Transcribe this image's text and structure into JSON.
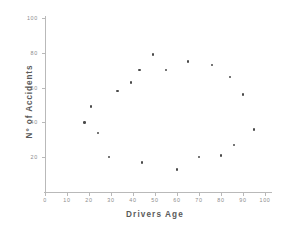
{
  "chart_data": {
    "type": "scatter",
    "title": "",
    "xlabel": "Drivers Age",
    "ylabel": "N° of Accidents",
    "xlim": [
      0,
      100
    ],
    "ylim": [
      0,
      100
    ],
    "grid": false,
    "legend": null,
    "xticks": [
      "0",
      "10",
      "20",
      "30",
      "40",
      "50",
      "60",
      "70",
      "80",
      "90",
      "100"
    ],
    "xtick_values": [
      0,
      10,
      20,
      30,
      40,
      50,
      60,
      70,
      80,
      90,
      100
    ],
    "yticks": [
      "20",
      "40",
      "60",
      "80",
      "100"
    ],
    "ytick_values": [
      20,
      40,
      60,
      80,
      100
    ],
    "marker_color": "#4a4a4a",
    "marker_shape": "circle",
    "points": [
      {
        "x": 18,
        "y": 40
      },
      {
        "x": 21,
        "y": 49
      },
      {
        "x": 24,
        "y": 34
      },
      {
        "x": 29,
        "y": 20
      },
      {
        "x": 33,
        "y": 58
      },
      {
        "x": 39,
        "y": 63
      },
      {
        "x": 43,
        "y": 70
      },
      {
        "x": 44,
        "y": 17
      },
      {
        "x": 49,
        "y": 79
      },
      {
        "x": 55,
        "y": 70
      },
      {
        "x": 60,
        "y": 13
      },
      {
        "x": 65,
        "y": 75
      },
      {
        "x": 70,
        "y": 20
      },
      {
        "x": 76,
        "y": 73
      },
      {
        "x": 80,
        "y": 21
      },
      {
        "x": 84,
        "y": 66
      },
      {
        "x": 86,
        "y": 27
      },
      {
        "x": 90,
        "y": 56
      },
      {
        "x": 95,
        "y": 36
      }
    ]
  },
  "axis": {
    "x_title": "Drivers Age",
    "y_title": "N° of Accidents"
  }
}
